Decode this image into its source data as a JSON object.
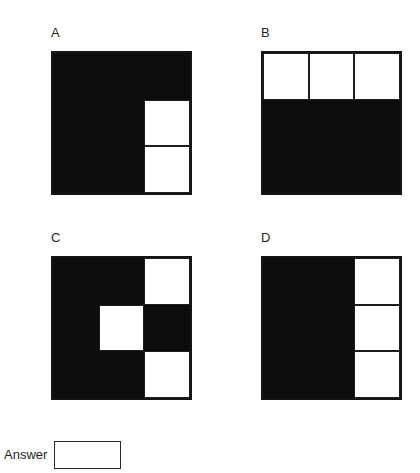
{
  "colors": {
    "filled": "#0d0d0d",
    "empty": "#ffffff",
    "border": "#161616"
  },
  "options": [
    {
      "label": "A",
      "grid": [
        [
          "black",
          "black",
          "black"
        ],
        [
          "black",
          "black",
          "white"
        ],
        [
          "black",
          "black",
          "white"
        ]
      ]
    },
    {
      "label": "B",
      "grid": [
        [
          "white",
          "white",
          "white"
        ],
        [
          "black",
          "black",
          "black"
        ],
        [
          "black",
          "black",
          "black"
        ]
      ]
    },
    {
      "label": "C",
      "grid": [
        [
          "black",
          "black",
          "white"
        ],
        [
          "black",
          "white",
          "black"
        ],
        [
          "black",
          "black",
          "white"
        ]
      ]
    },
    {
      "label": "D",
      "grid": [
        [
          "black",
          "black",
          "white"
        ],
        [
          "black",
          "black",
          "white"
        ],
        [
          "black",
          "black",
          "white"
        ]
      ]
    }
  ],
  "answer": {
    "label": "Answer",
    "value": ""
  }
}
